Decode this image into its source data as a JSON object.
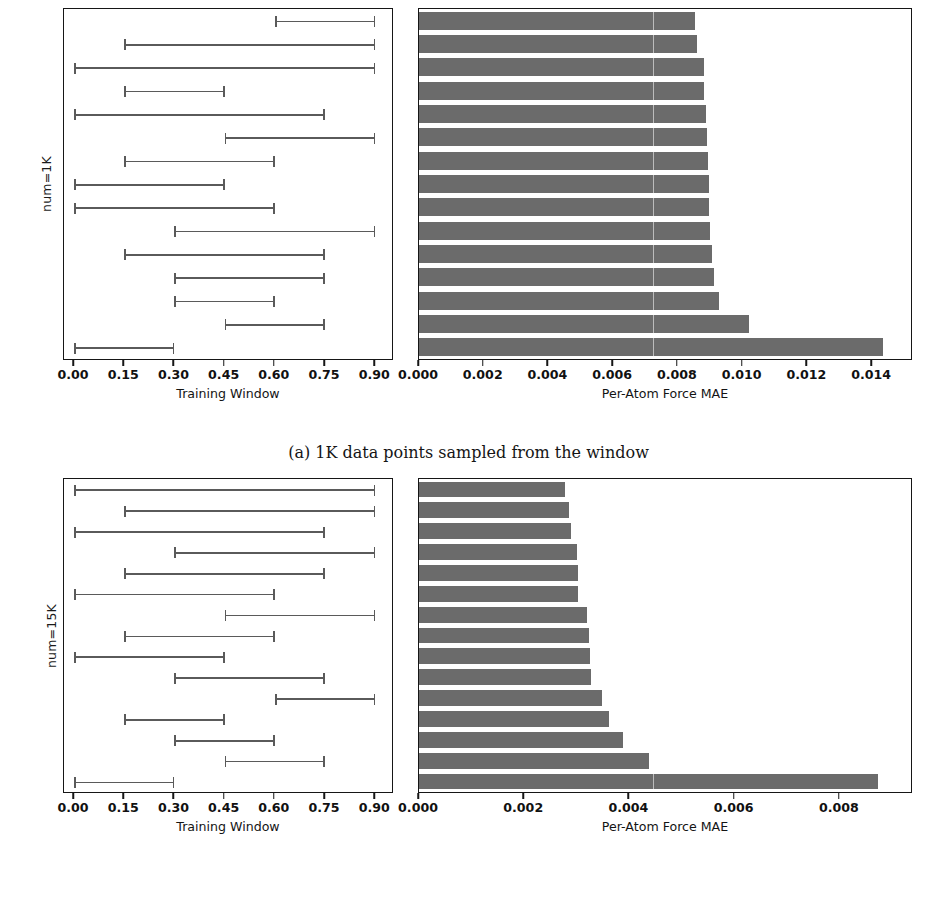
{
  "clipped_header_text": "",
  "figure": {
    "caption_a": "(a) 1K data points sampled from the window",
    "axis_labels": {
      "training_window": "Training Window",
      "force_mae": "Per-Atom Force MAE"
    },
    "colors": {
      "bar_fill": "#6b6b6b",
      "interval_line": "#5a5a5a",
      "axis": "#161616",
      "text": "#1b1b1b",
      "background": "#ffffff"
    }
  },
  "chart_data": [
    {
      "type": "bar",
      "id": "num-1k",
      "title": "",
      "group_label": "num=1K",
      "xlabel": "Per-Atom Force MAE",
      "ylabel": "num=1K",
      "xlim": [
        0.0,
        0.0152
      ],
      "xticks": [
        0.0,
        0.002,
        0.004,
        0.006,
        0.008,
        0.01,
        0.012,
        0.014
      ],
      "xticklabels": [
        "0.000",
        "0.002",
        "0.004",
        "0.006",
        "0.008",
        "0.010",
        "0.012",
        "0.014"
      ],
      "grid": false,
      "legend": "none",
      "categories": [
        "0.60-0.90",
        "0.15-0.90",
        "0.00-0.90",
        "0.15-0.45",
        "0.00-0.75",
        "0.45-0.90",
        "0.15-0.60",
        "0.00-0.45",
        "0.00-0.60",
        "0.30-0.90",
        "0.15-0.75",
        "0.30-0.75",
        "0.30-0.60",
        "0.45-0.75",
        "0.00-0.30"
      ],
      "values": [
        0.00852,
        0.00858,
        0.0088,
        0.00882,
        0.00886,
        0.0089,
        0.00893,
        0.00895,
        0.00897,
        0.00899,
        0.00905,
        0.0091,
        0.00928,
        0.01018,
        0.01432
      ],
      "windows": [
        {
          "start": 0.6,
          "end": 0.9
        },
        {
          "start": 0.15,
          "end": 0.9
        },
        {
          "start": 0.0,
          "end": 0.9
        },
        {
          "start": 0.15,
          "end": 0.45
        },
        {
          "start": 0.0,
          "end": 0.75
        },
        {
          "start": 0.45,
          "end": 0.9
        },
        {
          "start": 0.15,
          "end": 0.6
        },
        {
          "start": 0.0,
          "end": 0.45
        },
        {
          "start": 0.0,
          "end": 0.6
        },
        {
          "start": 0.3,
          "end": 0.9
        },
        {
          "start": 0.15,
          "end": 0.75
        },
        {
          "start": 0.3,
          "end": 0.75
        },
        {
          "start": 0.3,
          "end": 0.6
        },
        {
          "start": 0.45,
          "end": 0.75
        },
        {
          "start": 0.0,
          "end": 0.3
        }
      ],
      "window_axis": {
        "xlabel": "Training Window",
        "xlim": [
          -0.03,
          0.95
        ],
        "xticks": [
          0.0,
          0.15,
          0.3,
          0.45,
          0.6,
          0.75,
          0.9
        ],
        "xticklabels": [
          "0.00",
          "0.15",
          "0.30",
          "0.45",
          "0.60",
          "0.75",
          "0.90"
        ]
      }
    },
    {
      "type": "bar",
      "id": "num-15k",
      "title": "",
      "group_label": "num=15K",
      "xlabel": "Per-Atom Force MAE",
      "ylabel": "num=15K",
      "xlim": [
        0.0,
        0.00935
      ],
      "xticks": [
        0.0,
        0.002,
        0.004,
        0.006,
        0.008
      ],
      "xticklabels": [
        "0.000",
        "0.002",
        "0.004",
        "0.006",
        "0.008"
      ],
      "grid": false,
      "legend": "none",
      "categories": [
        "0.00-0.90",
        "0.15-0.90",
        "0.00-0.75",
        "0.30-0.90",
        "0.15-0.75",
        "0.00-0.60",
        "0.45-0.90",
        "0.15-0.60",
        "0.00-0.45",
        "0.30-0.75",
        "0.60-0.90",
        "0.15-0.45",
        "0.30-0.60",
        "0.45-0.75",
        "0.00-0.30"
      ],
      "values": [
        0.00277,
        0.00285,
        0.00288,
        0.003,
        0.00302,
        0.00303,
        0.0032,
        0.00323,
        0.00325,
        0.00326,
        0.00348,
        0.00362,
        0.00388,
        0.00437,
        0.00872
      ],
      "windows": [
        {
          "start": 0.0,
          "end": 0.9
        },
        {
          "start": 0.15,
          "end": 0.9
        },
        {
          "start": 0.0,
          "end": 0.75
        },
        {
          "start": 0.3,
          "end": 0.9
        },
        {
          "start": 0.15,
          "end": 0.75
        },
        {
          "start": 0.0,
          "end": 0.6
        },
        {
          "start": 0.45,
          "end": 0.9
        },
        {
          "start": 0.15,
          "end": 0.6
        },
        {
          "start": 0.0,
          "end": 0.45
        },
        {
          "start": 0.3,
          "end": 0.75
        },
        {
          "start": 0.6,
          "end": 0.9
        },
        {
          "start": 0.15,
          "end": 0.45
        },
        {
          "start": 0.3,
          "end": 0.6
        },
        {
          "start": 0.45,
          "end": 0.75
        },
        {
          "start": 0.0,
          "end": 0.3
        }
      ],
      "window_axis": {
        "xlabel": "Training Window",
        "xlim": [
          -0.03,
          0.95
        ],
        "xticks": [
          0.0,
          0.15,
          0.3,
          0.45,
          0.6,
          0.75,
          0.9
        ],
        "xticklabels": [
          "0.00",
          "0.15",
          "0.30",
          "0.45",
          "0.60",
          "0.75",
          "0.90"
        ]
      }
    }
  ]
}
